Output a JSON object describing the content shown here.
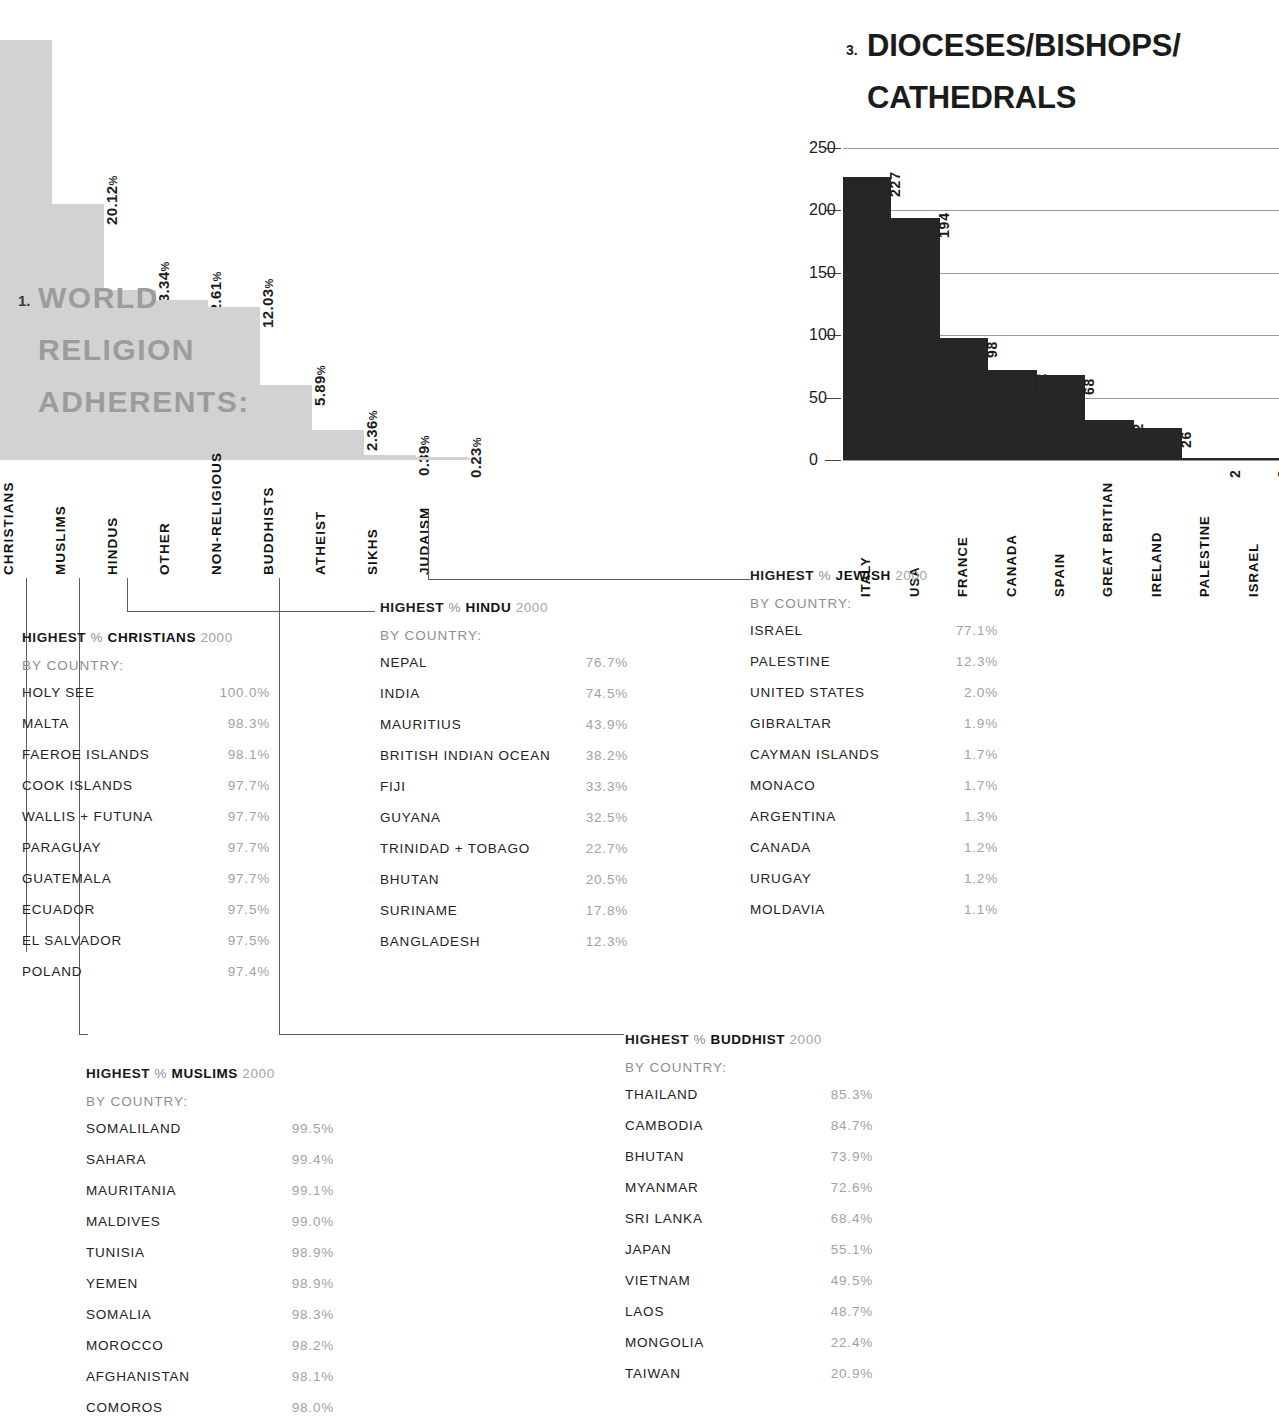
{
  "chart_data": [
    {
      "type": "bar",
      "id": "world-religion-adherents",
      "number": "1.",
      "title": "WORLD\nRELIGION\nADHERENTS:",
      "categories": [
        "CHRISTIANS",
        "MUSLIMS",
        "HINDUS",
        "OTHER",
        "NON-RELIGIOUS",
        "BUDDHISTS",
        "ATHEIST",
        "SIKHS",
        "JUDAISM"
      ],
      "values": [
        33.03,
        20.12,
        13.34,
        12.61,
        12.03,
        5.89,
        2.36,
        0.39,
        0.23
      ],
      "value_labels": [
        "",
        "20.12%",
        "13.34%",
        "12.61%",
        "12.03%",
        "5.89%",
        "2.36%",
        "0.39%",
        "0.23%"
      ],
      "unit": "%",
      "xlabel": "",
      "ylabel": "",
      "ylim": [
        0,
        36
      ],
      "grid": false,
      "bar_color": "#d2d2d2"
    },
    {
      "type": "bar",
      "id": "dioceses-bishops-cathedrals",
      "number": "3.",
      "title": "DIOCESES/BISHOPS/ CATHEDRALS",
      "categories": [
        "ITALY",
        "USA",
        "FRANCE",
        "CANADA",
        "SPAIN",
        "GREAT BRITIAN",
        "IRELAND",
        "PALESTINE",
        "ISRAEL"
      ],
      "values": [
        227,
        194,
        98,
        72,
        68,
        32,
        26,
        2,
        2
      ],
      "value_labels": [
        "227",
        "194",
        "98",
        "72",
        "68",
        "32",
        "26",
        "2",
        "2"
      ],
      "yticks": [
        0,
        50,
        100,
        150,
        200,
        250
      ],
      "ylim": [
        0,
        250
      ],
      "xlabel": "",
      "ylabel": "",
      "grid": true,
      "bar_color": "#262626"
    }
  ],
  "lists": [
    {
      "id": "christians",
      "head_highest": "HIGHEST",
      "head_pct": "%",
      "head_religion": "CHRISTIANS",
      "head_year": "2000",
      "subhead": "BY COUNTRY:",
      "rows": [
        {
          "country": "HOLY SEE",
          "value": "100.0%"
        },
        {
          "country": "MALTA",
          "value": "98.3%"
        },
        {
          "country": "FAEROE ISLANDS",
          "value": "98.1%"
        },
        {
          "country": "COOK ISLANDS",
          "value": "97.7%"
        },
        {
          "country": "WALLIS + FUTUNA",
          "value": "97.7%"
        },
        {
          "country": "PARAGUAY",
          "value": "97.7%"
        },
        {
          "country": "GUATEMALA",
          "value": "97.7%"
        },
        {
          "country": "ECUADOR",
          "value": "97.5%"
        },
        {
          "country": "EL SALVADOR",
          "value": "97.5%"
        },
        {
          "country": "POLAND",
          "value": "97.4%"
        }
      ]
    },
    {
      "id": "hindu",
      "head_highest": "HIGHEST",
      "head_pct": "%",
      "head_religion": "HINDU",
      "head_year": "2000",
      "subhead": "BY COUNTRY:",
      "rows": [
        {
          "country": "NEPAL",
          "value": "76.7%"
        },
        {
          "country": "INDIA",
          "value": "74.5%"
        },
        {
          "country": "MAURITIUS",
          "value": "43.9%"
        },
        {
          "country": "BRITISH INDIAN OCEAN",
          "value": "38.2%"
        },
        {
          "country": "FIJI",
          "value": "33.3%"
        },
        {
          "country": "GUYANA",
          "value": "32.5%"
        },
        {
          "country": "TRINIDAD + TOBAGO",
          "value": "22.7%"
        },
        {
          "country": "BHUTAN",
          "value": "20.5%"
        },
        {
          "country": "SURINAME",
          "value": "17.8%"
        },
        {
          "country": "BANGLADESH",
          "value": "12.3%"
        }
      ]
    },
    {
      "id": "jewish",
      "head_highest": "HIGHEST",
      "head_pct": "%",
      "head_religion": "JEWISH",
      "head_year": "2000",
      "subhead": "BY COUNTRY:",
      "rows": [
        {
          "country": "ISRAEL",
          "value": "77.1%"
        },
        {
          "country": "PALESTINE",
          "value": "12.3%"
        },
        {
          "country": "UNITED STATES",
          "value": "2.0%"
        },
        {
          "country": "GIBRALTAR",
          "value": "1.9%"
        },
        {
          "country": "CAYMAN ISLANDS",
          "value": "1.7%"
        },
        {
          "country": "MONACO",
          "value": "1.7%"
        },
        {
          "country": "ARGENTINA",
          "value": "1.3%"
        },
        {
          "country": "CANADA",
          "value": "1.2%"
        },
        {
          "country": "URUGAY",
          "value": "1.2%"
        },
        {
          "country": "MOLDAVIA",
          "value": "1.1%"
        }
      ]
    },
    {
      "id": "muslims",
      "head_highest": "HIGHEST",
      "head_pct": "%",
      "head_religion": "MUSLIMS",
      "head_year": "2000",
      "subhead": "BY COUNTRY:",
      "rows": [
        {
          "country": "SOMALILAND",
          "value": "99.5%"
        },
        {
          "country": "SAHARA",
          "value": "99.4%"
        },
        {
          "country": "MAURITANIA",
          "value": "99.1%"
        },
        {
          "country": "MALDIVES",
          "value": "99.0%"
        },
        {
          "country": "TUNISIA",
          "value": "98.9%"
        },
        {
          "country": "YEMEN",
          "value": "98.9%"
        },
        {
          "country": "SOMALIA",
          "value": "98.3%"
        },
        {
          "country": "MOROCCO",
          "value": "98.2%"
        },
        {
          "country": "AFGHANISTAN",
          "value": "98.1%"
        },
        {
          "country": "COMOROS",
          "value": "98.0%"
        }
      ]
    },
    {
      "id": "buddhist",
      "head_highest": "HIGHEST",
      "head_pct": "%",
      "head_religion": "BUDDHIST",
      "head_year": "2000",
      "subhead": "BY COUNTRY:",
      "rows": [
        {
          "country": "THAILAND",
          "value": "85.3%"
        },
        {
          "country": "CAMBODIA",
          "value": "84.7%"
        },
        {
          "country": "BHUTAN",
          "value": "73.9%"
        },
        {
          "country": "MYANMAR",
          "value": "72.6%"
        },
        {
          "country": "SRI LANKA",
          "value": "68.4%"
        },
        {
          "country": "JAPAN",
          "value": "55.1%"
        },
        {
          "country": "VIETNAM",
          "value": "49.5%"
        },
        {
          "country": "LAOS",
          "value": "48.7%"
        },
        {
          "country": "MONGOLIA",
          "value": "22.4%"
        },
        {
          "country": "TAIWAN",
          "value": "20.9%"
        }
      ]
    }
  ],
  "colors": {
    "chart1_bar": "#d2d2d2",
    "chart1_title": "#9c9c9c",
    "chart3_bar": "#262626",
    "value_text": "#a2a2a2",
    "country_text": "#232323"
  }
}
